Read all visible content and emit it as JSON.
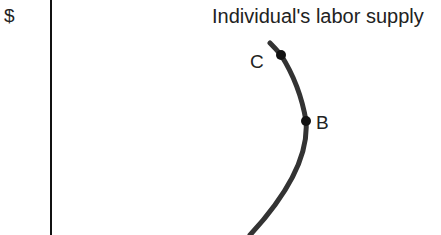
{
  "diagram": {
    "y_axis_label": "$",
    "curve_label": "Individual's labor supply",
    "points": [
      {
        "label": "C"
      },
      {
        "label": "B"
      }
    ],
    "colors": {
      "curve": "#333333",
      "axis": "#111111",
      "text": "#222222"
    }
  }
}
